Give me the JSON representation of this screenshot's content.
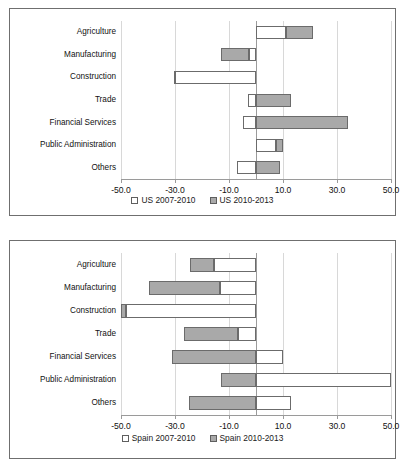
{
  "chart_data": [
    {
      "id": "us",
      "type": "bar",
      "orientation": "horizontal",
      "stacked": true,
      "title": "",
      "xlabel": "",
      "ylabel": "",
      "xlim": [
        -50.0,
        50.0
      ],
      "xticks": [
        "-50.0",
        "-30.0",
        "-10.0",
        "10.0",
        "30.0",
        "50.0"
      ],
      "xtick_values": [
        -50,
        -30,
        -10,
        10,
        30,
        50
      ],
      "grid": true,
      "legend_position": "bottom",
      "categories": [
        "Agriculture",
        "Manufacturing",
        "Construction",
        "Trade",
        "Financial Services",
        "Public Administration",
        "Others"
      ],
      "series": [
        {
          "name": "US  2007-2010",
          "color": "#ffffff",
          "values": [
            11.0,
            -2.5,
            -30.0,
            -3.0,
            -5.0,
            7.5,
            -7.0
          ]
        },
        {
          "name": "US 2010-2013",
          "color": "#a9a9a9",
          "values": [
            10.0,
            -10.5,
            -0.5,
            13.0,
            34.0,
            2.5,
            9.0
          ]
        }
      ]
    },
    {
      "id": "spain",
      "type": "bar",
      "orientation": "horizontal",
      "stacked": true,
      "title": "",
      "xlabel": "",
      "ylabel": "",
      "xlim": [
        -50.0,
        50.0
      ],
      "xticks": [
        "-50.0",
        "-30.0",
        "-10.0",
        "10.0",
        "30.0",
        "50.0"
      ],
      "xtick_values": [
        -50,
        -30,
        -10,
        10,
        30,
        50
      ],
      "grid": true,
      "legend_position": "bottom",
      "categories": [
        "Agriculture",
        "Manufacturing",
        "Construction",
        "Trade",
        "Financial Services",
        "Public Administration",
        "Others"
      ],
      "series": [
        {
          "name": "Spain 2007-2010",
          "color": "#ffffff",
          "values": [
            -15.5,
            -13.5,
            -48.0,
            -6.5,
            10.0,
            50.0,
            13.0
          ]
        },
        {
          "name": "Spain 2010-2013",
          "color": "#a9a9a9",
          "values": [
            -9.0,
            -26.0,
            -2.0,
            -20.0,
            -31.0,
            -13.0,
            -25.0
          ]
        }
      ]
    }
  ]
}
